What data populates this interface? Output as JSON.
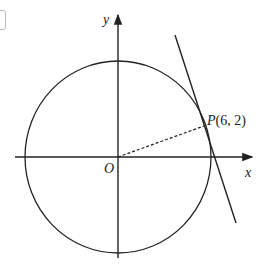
{
  "diagram": {
    "type": "circle-with-tangent",
    "axes": {
      "x_label": "x",
      "y_label": "y",
      "origin_label": "O"
    },
    "point": {
      "label_prefix": "P",
      "label_coords": "(6, 2)",
      "x": 6,
      "y": 2
    },
    "elements": [
      "circle centered at origin",
      "tangent line at P",
      "dashed radius OP",
      "x-axis arrow",
      "y-axis arrow"
    ],
    "colors": {
      "stroke": "#222222",
      "background": "#ffffff"
    }
  }
}
